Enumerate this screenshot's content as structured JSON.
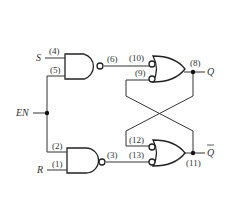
{
  "diagram": {
    "inputs": {
      "s": "S",
      "r": "R",
      "en": "EN"
    },
    "outputs": {
      "q": "Q",
      "q_bar": "Q"
    },
    "pins": {
      "p4": "(4)",
      "p5": "(5)",
      "p6": "(6)",
      "p10": "(10)",
      "p9": "(9)",
      "p8": "(8)",
      "p2": "(2)",
      "p1": "(1)",
      "p3": "(3)",
      "p12": "(12)",
      "p13": "(13)",
      "p11": "(11)"
    },
    "gates": [
      {
        "id": "nand-top",
        "type": "NAND",
        "inputs": [
          "(4)",
          "(5)"
        ],
        "output": "(6)"
      },
      {
        "id": "nand-bottom",
        "type": "NAND",
        "inputs": [
          "(2)",
          "(1)"
        ],
        "output": "(3)"
      },
      {
        "id": "or-top",
        "type": "negative-OR",
        "inputs": [
          "(10)",
          "(9)"
        ],
        "output": "(8)"
      },
      {
        "id": "or-bottom",
        "type": "negative-OR",
        "inputs": [
          "(12)",
          "(13)"
        ],
        "output": "(11)"
      }
    ]
  }
}
